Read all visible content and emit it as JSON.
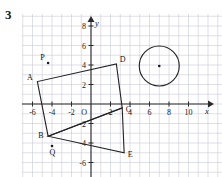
{
  "problem": {
    "number": "3"
  },
  "chart_data": {
    "type": "scatter",
    "title": "",
    "xlabel": "x",
    "ylabel": "y",
    "grid": true,
    "legend": null,
    "xlim": [
      -7,
      11.5
    ],
    "ylim": [
      -7,
      9
    ],
    "xticks": [
      -6,
      -4,
      -2,
      2,
      4,
      6,
      8,
      10
    ],
    "xtick_labels": [
      "-6",
      "-4",
      "-2",
      "2",
      "4",
      "6",
      "8",
      "10"
    ],
    "yticks": [
      -6,
      -4,
      -2,
      2,
      4,
      6,
      8
    ],
    "ytick_labels": [
      "-6",
      "-4",
      "-2",
      "2",
      "4",
      "6",
      "8"
    ],
    "origin_label": "O",
    "grid_step": 1,
    "shapes": [
      {
        "name": "quadrilateral-ABCD",
        "type": "polygon",
        "closed": true,
        "vertices": [
          {
            "label": "A",
            "x": -5.5,
            "y": 2.3
          },
          {
            "label": "B",
            "x": -4.4,
            "y": -3.3
          },
          {
            "label": "C",
            "x": 3.2,
            "y": -0.4
          },
          {
            "label": "D",
            "x": 2.6,
            "y": 4.1
          }
        ]
      },
      {
        "name": "triangle-BCE",
        "type": "polygon",
        "closed": true,
        "vertices": [
          {
            "label": "B",
            "x": -4.4,
            "y": -3.3
          },
          {
            "label": "C",
            "x": 3.2,
            "y": -0.4
          },
          {
            "label": "E",
            "x": 3.4,
            "y": -5.0
          }
        ]
      },
      {
        "name": "circle-center-point",
        "type": "circle",
        "cx": 7.0,
        "cy": 3.9,
        "r": 2.05
      }
    ],
    "marked_points": [
      {
        "label": "P",
        "x": -4.4,
        "y": 4.2,
        "label_offset": "above-left"
      },
      {
        "label": "Q",
        "x": -4.0,
        "y": -4.3,
        "label_offset": "below"
      },
      {
        "label": "",
        "x": 7.0,
        "y": 3.9,
        "label_offset": "none"
      }
    ],
    "vertex_labels": [
      {
        "label": "A",
        "x": -5.5,
        "y": 2.3
      },
      {
        "label": "B",
        "x": -4.4,
        "y": -3.3
      },
      {
        "label": "C",
        "x": 3.2,
        "y": -0.4
      },
      {
        "label": "D",
        "x": 2.6,
        "y": 4.1
      },
      {
        "label": "E",
        "x": 3.4,
        "y": -5.0
      }
    ]
  },
  "colors": {
    "grid": "#c9c9d6",
    "axis": "#2a2a2a",
    "shape": "#222222",
    "text": "#1a1a1a",
    "background": "#ffffff"
  }
}
